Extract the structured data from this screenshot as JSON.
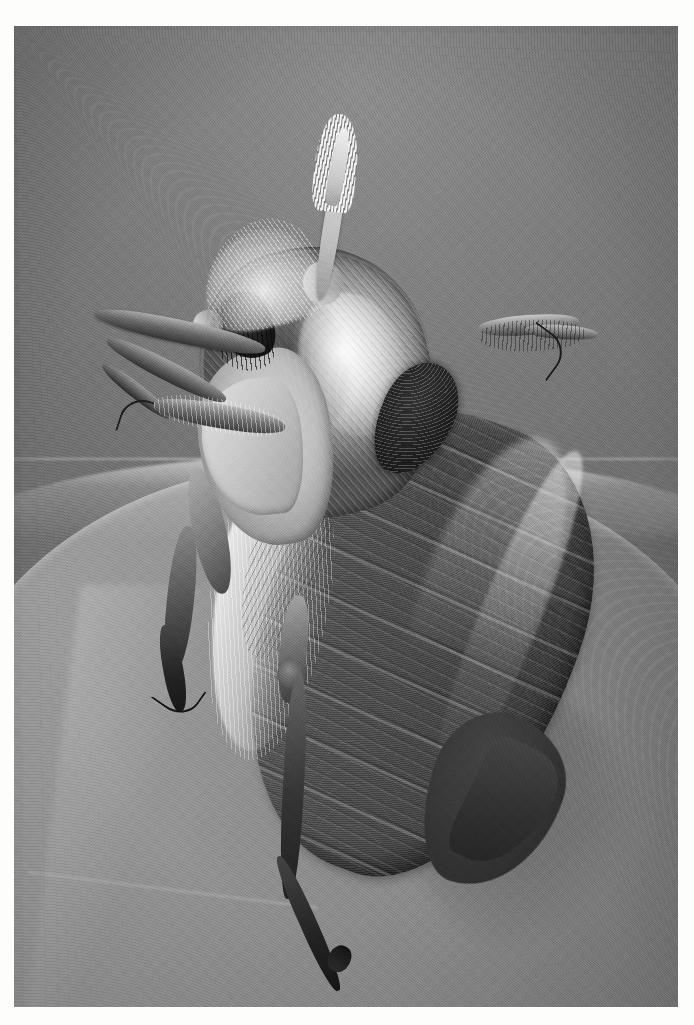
{
  "document": {
    "type": "photograph",
    "medium": "halftone-printed black and white photograph",
    "orientation": "portrait",
    "border": "white paper margin",
    "caption": ""
  },
  "photo": {
    "subject": "cockchafer beetle (May bug) perched on the curved edge of a leaf",
    "view": "three-quarter dorsal-lateral close-up",
    "palette": {
      "paper": "#fdfdfb",
      "background_field": "#787878",
      "leaf_light": "#9d9d9d",
      "leaf_mid": "#888888",
      "elytra_dark": "#40392f",
      "elytra_mid": "#5a544c",
      "pronotum_highlight": "#dedad2",
      "scutellum_black": "#191512",
      "antenna_cream": "#efece6"
    },
    "parts": [
      {
        "name": "antenna",
        "label": "lamellate antennal club"
      },
      {
        "name": "head",
        "label": "head and clypeus"
      },
      {
        "name": "eye",
        "label": "compound eye"
      },
      {
        "name": "pronotum",
        "label": "pronotum with specular highlight"
      },
      {
        "name": "scutellum",
        "label": "dark scutellum"
      },
      {
        "name": "elytra",
        "label": "ridged elytra (wing cases)"
      },
      {
        "name": "pygidium",
        "label": "pointed pygidium"
      },
      {
        "name": "legs",
        "label": "six legs with tarsal claws"
      },
      {
        "name": "leaf",
        "label": "curved leaf substrate"
      }
    ]
  }
}
